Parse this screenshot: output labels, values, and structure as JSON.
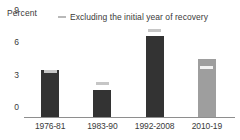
{
  "chart_data": {
    "type": "bar",
    "title": "",
    "xlabel": "",
    "ylabel": "Percent",
    "ylim": [
      0,
      9
    ],
    "yticks": [
      "0",
      "3",
      "6",
      "9"
    ],
    "ytick_values": [
      0,
      3,
      6,
      9
    ],
    "grid": false,
    "categories": [
      "1976-81",
      "1983-90",
      "1992-2008",
      "2010-19"
    ],
    "series": [
      {
        "name": "Average growth",
        "type": "bar",
        "values": [
          4.35,
          2.5,
          7.5,
          5.4
        ],
        "colors": [
          "#333333",
          "#333333",
          "#333333",
          "#9e9e9e"
        ]
      },
      {
        "name": "Excluding the initial year of recovery",
        "type": "marker",
        "values": [
          4.2,
          3.15,
          8.0,
          4.6
        ],
        "colors": [
          "#c6c6c6",
          "#c6c6c6",
          "#c6c6c6",
          "#f2f2f2"
        ]
      }
    ],
    "legend": {
      "position": "top",
      "entries": [
        "Excluding the initial year of recovery"
      ]
    },
    "annotations": []
  },
  "axis": {
    "unit_label": "Percent"
  },
  "legend": {
    "label": "Excluding the initial year of recovery",
    "swatch_color": "#b9b9b9"
  },
  "colors": {
    "bar_dark": "#333333",
    "bar_light": "#9e9e9e",
    "marker_grey": "#c6c6c6",
    "marker_white": "#f2f2f2",
    "axis": "#8e8e8e",
    "text": "#3a3a3a",
    "background": "#ffffff"
  }
}
